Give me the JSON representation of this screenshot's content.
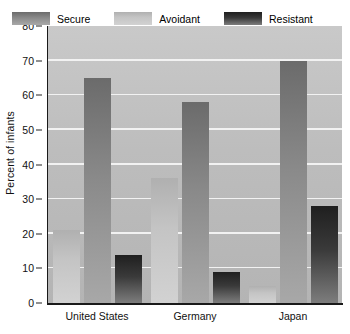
{
  "chart_data": {
    "type": "bar",
    "title": "",
    "xlabel": "",
    "ylabel": "Percent of infants",
    "ylim": [
      0,
      80
    ],
    "ytick_step": 10,
    "yticks": [
      0,
      10,
      20,
      30,
      40,
      50,
      60,
      70,
      80
    ],
    "categories": [
      "United States",
      "Germany",
      "Japan"
    ],
    "grid": true,
    "legend_position": "top-inside",
    "series": [
      {
        "name": "Avoidant",
        "color": "#c4c4c4",
        "values": [
          21,
          36,
          5
        ]
      },
      {
        "name": "Secure",
        "color": "#8a8a8a",
        "values": [
          65,
          58,
          70
        ]
      },
      {
        "name": "Resistant",
        "color": "#3a3a3a",
        "values": [
          14,
          9,
          28
        ]
      }
    ],
    "bar_order_in_group": [
      "Avoidant",
      "Secure",
      "Resistant"
    ],
    "legend_order": [
      "Secure",
      "Avoidant",
      "Resistant"
    ]
  },
  "legend": {
    "entries": [
      {
        "label": "Secure",
        "swatch": "legend-swatch-secure"
      },
      {
        "label": "Avoidant",
        "swatch": "legend-swatch-avoidant"
      },
      {
        "label": "Resistant",
        "swatch": "legend-swatch-resistant"
      }
    ]
  },
  "axis": {
    "y_title": "Percent of infants"
  },
  "colors": {
    "plot_background": "#bdbdbd",
    "page_background": "#ffffff",
    "gridline": "#f2f2f2",
    "axis": "#1a1a1a",
    "secure": "#8a8a8a",
    "avoidant": "#c4c4c4",
    "resistant": "#3a3a3a"
  }
}
